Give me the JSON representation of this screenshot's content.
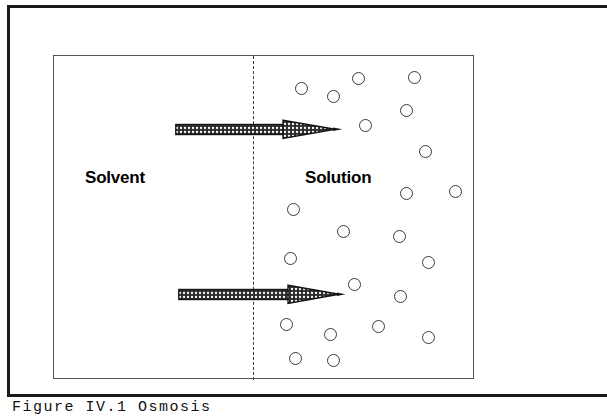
{
  "figure": {
    "type": "osmosis-diagram",
    "outer_frame": {
      "visible": true,
      "cropped_right": true
    },
    "caption": "Figure  IV.1  Osmosis",
    "membrane": {
      "name": "semipermeable-membrane",
      "style": "dashed",
      "x": 252,
      "y_top": 55,
      "y_bottom": 379
    },
    "regions": [
      {
        "id": "solvent",
        "label": "Solvent",
        "side": "left",
        "solute_count": 0
      },
      {
        "id": "solution",
        "label": "Solution",
        "side": "right",
        "solute_count": 26
      }
    ],
    "arrows": [
      {
        "id": "flow-arrow-top",
        "label": "solvent flow",
        "direction": "right",
        "x": 175,
        "y": 118
      },
      {
        "id": "flow-arrow-bottom",
        "label": "solvent flow",
        "direction": "right",
        "x": 178,
        "y": 283
      }
    ],
    "box": {
      "x": 53,
      "y": 55,
      "width": 421,
      "height": 324
    },
    "colors": {
      "ink": "#1a1a1a",
      "box_stroke": "#555555",
      "membrane": "#3b3b3b",
      "solute_stroke": "#3a3a3a",
      "arrow_fill": "#2b2b2b",
      "background": "#ffffff"
    },
    "solutes": [
      {
        "x": 301,
        "y": 88
      },
      {
        "x": 333,
        "y": 96
      },
      {
        "x": 358,
        "y": 78
      },
      {
        "x": 414,
        "y": 77
      },
      {
        "x": 406,
        "y": 110
      },
      {
        "x": 365,
        "y": 125
      },
      {
        "x": 425,
        "y": 151
      },
      {
        "x": 406,
        "y": 193
      },
      {
        "x": 455,
        "y": 191
      },
      {
        "x": 293,
        "y": 209
      },
      {
        "x": 343,
        "y": 231
      },
      {
        "x": 399,
        "y": 236
      },
      {
        "x": 290,
        "y": 258
      },
      {
        "x": 428,
        "y": 262
      },
      {
        "x": 354,
        "y": 284
      },
      {
        "x": 400,
        "y": 296
      },
      {
        "x": 286,
        "y": 324
      },
      {
        "x": 378,
        "y": 326
      },
      {
        "x": 330,
        "y": 334
      },
      {
        "x": 428,
        "y": 337
      },
      {
        "x": 295,
        "y": 358
      },
      {
        "x": 333,
        "y": 360
      }
    ]
  }
}
